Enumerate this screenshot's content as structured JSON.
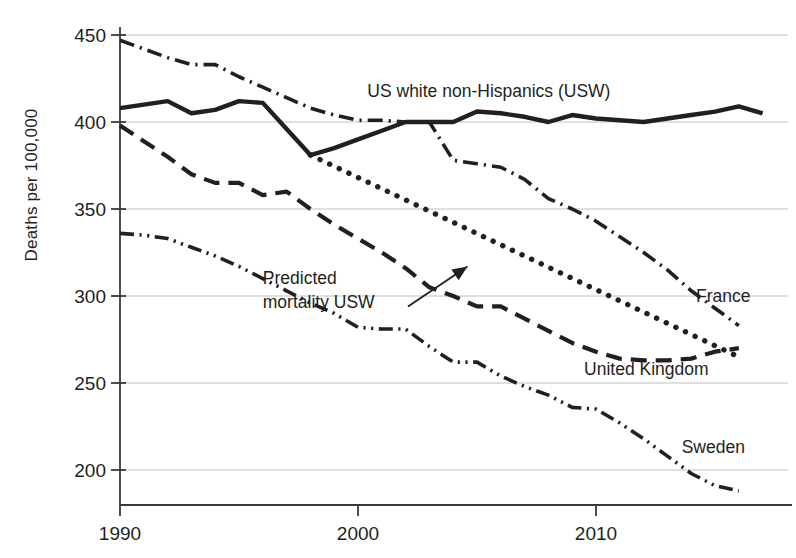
{
  "chart_data": {
    "type": "line",
    "title": "",
    "subtitle": "",
    "xlabel": "",
    "ylabel": "Deaths per 100,000",
    "xlim": [
      1989,
      2017.5
    ],
    "ylim": [
      180,
      455
    ],
    "xticks": [
      1990,
      2000,
      2010
    ],
    "xticklabels": [
      "1990",
      "2000",
      "2010"
    ],
    "yticks": [
      200,
      250,
      300,
      350,
      400,
      450
    ],
    "yticklabels": [
      "200",
      "250",
      "300",
      "350",
      "400",
      "450"
    ],
    "grid": "horizontal",
    "legend_position": "inline-labels",
    "annotations": [
      {
        "text_line1": "Predicted",
        "text_line2": "mortality USW",
        "text": "Predicted mortality USW",
        "arrow_from_x": 2002.1,
        "arrow_from_y": 294,
        "arrow_to_x": 2004.6,
        "arrow_to_y": 317
      }
    ],
    "series": [
      {
        "name": "US white non-Hispanics (USW)",
        "label": "US white non-Hispanics (USW)",
        "style": "solid",
        "linewidth": 4.4,
        "color": "#231f20",
        "label_x": 2005.5,
        "label_y": 418,
        "x": [
          1990,
          1991,
          1992,
          1993,
          1994,
          1995,
          1996,
          1997,
          1998,
          1999,
          2000,
          2001,
          2002,
          2003,
          2004,
          2005,
          2006,
          2007,
          2008,
          2009,
          2010,
          2011,
          2012,
          2013,
          2014,
          2015,
          2016,
          2017
        ],
        "y": [
          408,
          410,
          412,
          405,
          407,
          412,
          411,
          396,
          381,
          385,
          390,
          395,
          400,
          400,
          400,
          406,
          405,
          403,
          400,
          404,
          402,
          401,
          400,
          402,
          404,
          406,
          409,
          405
        ]
      },
      {
        "name": "France",
        "label": "France",
        "style": "dashdot",
        "linewidth": 3.6,
        "color": "#231f20",
        "label_x": 2014.2,
        "label_y": 300,
        "x": [
          1990,
          1991,
          1992,
          1993,
          1994,
          1995,
          1996,
          1997,
          1998,
          1999,
          2000,
          2001,
          2002,
          2003,
          2004,
          2005,
          2006,
          2007,
          2008,
          2009,
          2010,
          2011,
          2012,
          2013,
          2014,
          2015,
          2016
        ],
        "y": [
          447,
          442,
          437,
          433,
          433,
          426,
          420,
          414,
          408,
          404,
          401,
          401,
          400,
          400,
          378,
          376,
          374,
          367,
          356,
          350,
          343,
          334,
          325,
          315,
          303,
          293,
          283
        ]
      },
      {
        "name": "United Kingdom",
        "label": "United Kingdom",
        "style": "dashed",
        "linewidth": 4.2,
        "color": "#231f20",
        "label_x": 2009.5,
        "label_y": 258,
        "x": [
          1990,
          1991,
          1992,
          1993,
          1994,
          1995,
          1996,
          1997,
          1998,
          1999,
          2000,
          2001,
          2002,
          2003,
          2004,
          2005,
          2006,
          2007,
          2008,
          2009,
          2010,
          2011,
          2012,
          2013,
          2014,
          2015,
          2016
        ],
        "y": [
          398,
          389,
          380,
          370,
          365,
          365,
          358,
          360,
          350,
          341,
          333,
          325,
          316,
          305,
          300,
          294,
          294,
          287,
          280,
          273,
          268,
          264,
          263,
          263,
          264,
          268,
          270
        ]
      },
      {
        "name": "Sweden",
        "label": "Sweden",
        "style": "dashdotdot",
        "linewidth": 3.6,
        "color": "#231f20",
        "label_x": 2013.6,
        "label_y": 213,
        "x": [
          1990,
          1991,
          1992,
          1993,
          1994,
          1995,
          1996,
          1997,
          1998,
          1999,
          2000,
          2001,
          2002,
          2003,
          2004,
          2005,
          2006,
          2007,
          2008,
          2009,
          2010,
          2011,
          2012,
          2013,
          2014,
          2015,
          2016
        ],
        "y": [
          336,
          335,
          333,
          328,
          323,
          317,
          310,
          303,
          296,
          290,
          282,
          281,
          281,
          271,
          262,
          262,
          254,
          248,
          243,
          236,
          235,
          227,
          218,
          208,
          198,
          191,
          188
        ]
      },
      {
        "name": "Predicted mortality USW",
        "label": "",
        "style": "dotted",
        "linewidth": 5.4,
        "color": "#231f20",
        "x": [
          1998,
          2016
        ],
        "y": [
          381,
          265
        ]
      }
    ]
  }
}
